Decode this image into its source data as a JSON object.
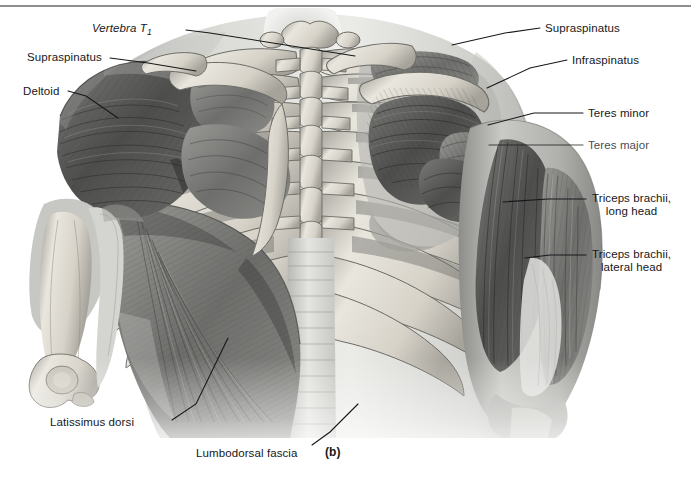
{
  "figure": {
    "designator": "(b)",
    "view": "posterior-superficial-musculature",
    "style": "grayscale-airbrush-anatomical-illustration"
  },
  "labels": [
    {
      "id": "vertebra-t1",
      "text": "Vertebra T",
      "subscript": "1",
      "italic": true,
      "align": "right",
      "x": 92,
      "y": 22,
      "leader": [
        [
          186,
          30
        ],
        [
          210,
          33
        ],
        [
          355,
          56
        ]
      ]
    },
    {
      "id": "supraspinatus-left",
      "text": "Supraspinatus",
      "italic": false,
      "align": "right",
      "x": 27,
      "y": 51,
      "leader": [
        [
          110,
          58
        ],
        [
          148,
          63
        ],
        [
          196,
          71
        ]
      ]
    },
    {
      "id": "deltoid",
      "text": "Deltoid",
      "italic": false,
      "align": "right",
      "x": 23,
      "y": 85,
      "leader": [
        [
          68,
          91
        ],
        [
          86,
          96
        ],
        [
          118,
          118
        ]
      ]
    },
    {
      "id": "supraspinatus-right",
      "text": "Supraspinatus",
      "italic": false,
      "align": "left",
      "x": 545,
      "y": 22,
      "leader": [
        [
          540,
          28
        ],
        [
          505,
          33
        ],
        [
          452,
          45
        ]
      ]
    },
    {
      "id": "infraspinatus",
      "text": "Infraspinatus",
      "italic": false,
      "align": "left",
      "x": 572,
      "y": 54,
      "leader": [
        [
          567,
          60
        ],
        [
          530,
          68
        ],
        [
          487,
          88
        ]
      ]
    },
    {
      "id": "teres-minor",
      "text": "Teres minor",
      "italic": false,
      "align": "left",
      "x": 588,
      "y": 107,
      "leader": [
        [
          583,
          113
        ],
        [
          534,
          113
        ],
        [
          488,
          125
        ]
      ]
    },
    {
      "id": "teres-major",
      "text": "Teres major",
      "italic": false,
      "faded": true,
      "align": "left",
      "x": 588,
      "y": 139,
      "leader": [
        [
          583,
          145
        ],
        [
          540,
          145
        ],
        [
          489,
          145
        ]
      ]
    },
    {
      "id": "triceps-brachii-long-head",
      "text": "Triceps brachii,\nlong head",
      "italic": false,
      "align": "left",
      "x": 592,
      "y": 192,
      "leader": [
        [
          586,
          199
        ],
        [
          548,
          199
        ],
        [
          503,
          202
        ]
      ]
    },
    {
      "id": "triceps-brachii-lateral-head",
      "text": "Triceps brachii,\nlateral head",
      "italic": false,
      "align": "left",
      "x": 592,
      "y": 248,
      "leader": [
        [
          586,
          255
        ],
        [
          550,
          255
        ],
        [
          525,
          258
        ]
      ]
    },
    {
      "id": "latissimus-dorsi",
      "text": "Latissimus dorsi",
      "italic": false,
      "align": "right",
      "x": 50,
      "y": 416,
      "leader": [
        [
          172,
          420
        ],
        [
          196,
          404
        ],
        [
          228,
          338
        ]
      ]
    },
    {
      "id": "lumbodorsal-fascia",
      "text": "Lumbodorsal fascia",
      "italic": false,
      "align": "right",
      "x": 196,
      "y": 447,
      "leader": [
        [
          312,
          445
        ],
        [
          330,
          432
        ],
        [
          358,
          404
        ]
      ]
    }
  ],
  "structures": {
    "spine": "thoracic and lumbar vertebral column with spinous processes",
    "ribs": "posterior rib cage, bilateral",
    "scapula_right": "right scapula with supraspinatus and infraspinatus",
    "scapula_left": "left scapula covered by deltoid",
    "humerus_left": "left humerus with distal epicondyles exposed",
    "arm_right": "right upper arm showing triceps brachii heads",
    "fascia": "lumbodorsal fascia, midline aponeurosis"
  }
}
